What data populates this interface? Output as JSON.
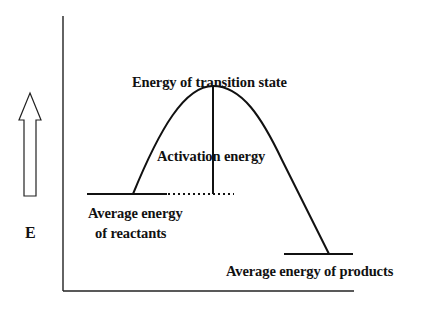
{
  "diagram": {
    "type": "energy-profile",
    "axis_label": "E",
    "labels": {
      "transition_state": "Energy of transition state",
      "activation_energy": "Activation energy",
      "reactants_line1": "Average energy",
      "reactants_line2": "of reactants",
      "products": "Average energy of products"
    },
    "icons": {
      "energy_arrow": "hollow-up-arrow"
    },
    "colors": {
      "stroke": "#111111",
      "background": "#ffffff"
    },
    "levels": {
      "reactants_y": 194,
      "transition_y": 86,
      "products_y": 254
    }
  }
}
